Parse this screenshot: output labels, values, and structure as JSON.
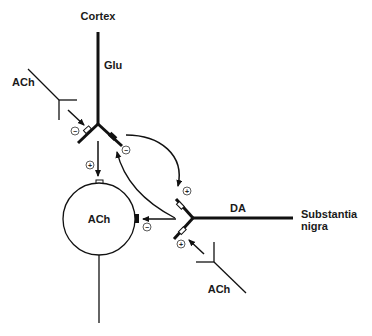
{
  "diagram": {
    "labels": {
      "cortex": "Cortex",
      "glu": "Glu",
      "ach_top_left": "ACh",
      "ach_cell": "ACh",
      "da": "DA",
      "substantia_1": "Substantia",
      "substantia_2": "nigra",
      "ach_bottom": "ACh"
    },
    "signs": {
      "glu_terminal_ach_input": "−",
      "glu_terminal_da_input": "−",
      "glu_to_cell": "+",
      "glu_to_da": "+",
      "da_to_cell": "−",
      "ach_to_da": "+"
    }
  }
}
